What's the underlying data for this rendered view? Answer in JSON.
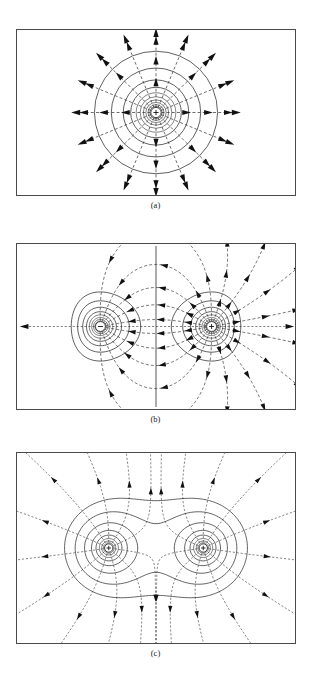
{
  "document": {
    "running_head": "",
    "figure_kind": "electrostatics-field-and-equipotential-diagrams"
  },
  "panels": [
    {
      "id": "a",
      "caption": "(a)",
      "name": "panel-a-single-positive-charge",
      "description": "Single positive point charge: concentric circular equipotentials with radial dashed field lines pointing outward",
      "charges": [
        {
          "sign": "+",
          "label": "+",
          "cx_frac": 0.5,
          "cy_frac": 0.5
        }
      ],
      "equipotential_radii": [
        3.2,
        4.6,
        6.2,
        8.0,
        10.2,
        12.8,
        16.0,
        20.0,
        25.5,
        33.0,
        45.0,
        62.0
      ],
      "field_line_count": 16,
      "field_line_style": "dashed-radial-outward",
      "arrow_radii": [
        30,
        52,
        72
      ],
      "box": {
        "x": 16,
        "y": 29,
        "w": 280,
        "h": 167
      }
    },
    {
      "id": "b",
      "caption": "(b)",
      "name": "panel-b-electric-dipole",
      "description": "Electric dipole: negative charge at left, positive charge at right, curved dashed field lines from plus to minus, straight vertical zero-potential equipotential line through the midplane",
      "charges": [
        {
          "sign": "-",
          "label": "−",
          "cx_frac": 0.3,
          "cy_frac": 0.5
        },
        {
          "sign": "+",
          "label": "+",
          "cx_frac": 0.7,
          "cy_frac": 0.5
        }
      ],
      "equipotential_radii": [
        3.0,
        4.2,
        5.6,
        7.2,
        9.2,
        11.8,
        15.0,
        19.5,
        26.0,
        35.0
      ],
      "field_line_count": 18,
      "field_line_style": "dashed-dipole-curves",
      "midplane_line": true,
      "box": {
        "x": 16,
        "y": 243,
        "w": 280,
        "h": 167
      }
    },
    {
      "id": "c",
      "caption": "(c)",
      "name": "panel-c-two-like-charges",
      "description": "Two like (positive) charges: figure-eight equipotential contours with a saddle point midway, dashed field lines radiating outward from both charges",
      "charges": [
        {
          "sign": "+",
          "label": "+",
          "cx_frac": 0.33,
          "cy_frac": 0.5
        },
        {
          "sign": "+",
          "label": "+",
          "cx_frac": 0.67,
          "cy_frac": 0.5
        }
      ],
      "equipotential_radii": [
        4.0,
        5.6,
        7.6,
        10.2,
        13.5,
        18.0,
        24.0,
        32.0,
        44.0,
        60.0,
        78.0
      ],
      "field_line_count": 22,
      "field_line_style": "dashed-outward-from-pair",
      "saddle_point": {
        "cx_frac": 0.5,
        "cy_frac": 0.5
      },
      "box": {
        "x": 16,
        "y": 452,
        "w": 280,
        "h": 192
      }
    }
  ],
  "chart_data": {
    "type": "diagram",
    "title": "",
    "subplots": [
      {
        "label": "(a)",
        "system": "point charge",
        "charge_values": [
          1
        ],
        "charge_positions_px": [
          [
            140,
            83
          ]
        ],
        "solid_curves": "equipotentials (circles)",
        "dashed_curves": "electric field lines (radial)",
        "n_field_lines": 16,
        "n_equipotentials": 12
      },
      {
        "label": "(b)",
        "system": "dipole",
        "charge_values": [
          -1,
          1
        ],
        "charge_positions_px": [
          [
            84,
            83
          ],
          [
            196,
            83
          ]
        ],
        "solid_curves": "equipotentials (closed loops + straight midplane)",
        "dashed_curves": "electric field lines (plus to minus)",
        "n_field_lines": 18,
        "n_equipotentials": 10
      },
      {
        "label": "(c)",
        "system": "two like charges",
        "charge_values": [
          1,
          1
        ],
        "charge_positions_px": [
          [
            92,
            96
          ],
          [
            188,
            96
          ]
        ],
        "solid_curves": "equipotentials (figure-eight with saddle)",
        "dashed_curves": "electric field lines (outward)",
        "n_field_lines": 22,
        "n_equipotentials": 11
      }
    ]
  }
}
